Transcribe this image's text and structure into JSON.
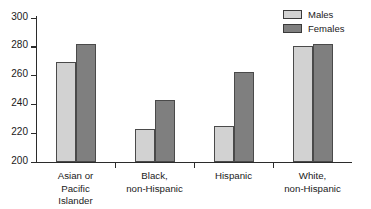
{
  "chart_data": {
    "type": "bar",
    "title": "",
    "xlabel": "",
    "ylabel": "",
    "ylim": [
      200,
      300
    ],
    "yticks": [
      200,
      220,
      240,
      260,
      280,
      300
    ],
    "grid": false,
    "legend_position": "top-right",
    "categories": [
      "Asian or\nPacific\nIslander",
      "Black,\nnon-Hispanic",
      "Hispanic",
      "White,\nnon-Hispanic"
    ],
    "series": [
      {
        "name": "Males",
        "color": "#d2d2d2",
        "values": [
          269,
          223,
          225,
          280
        ]
      },
      {
        "name": "Females",
        "color": "#7f7f7f",
        "values": [
          282,
          243,
          262,
          282
        ]
      }
    ]
  },
  "legend": {
    "items": [
      {
        "label": "Males",
        "color": "#d2d2d2"
      },
      {
        "label": "Females",
        "color": "#7f7f7f"
      }
    ]
  },
  "axes": {
    "y": {
      "ticks": [
        {
          "label": "300",
          "value": 300
        },
        {
          "label": "280",
          "value": 280
        },
        {
          "label": "260",
          "value": 260
        },
        {
          "label": "240",
          "value": 240
        },
        {
          "label": "220",
          "value": 220
        },
        {
          "label": "200",
          "value": 200
        }
      ]
    },
    "x": {
      "categories": [
        {
          "lines": [
            "Asian or",
            "Pacific",
            "Islander"
          ]
        },
        {
          "lines": [
            "Black,",
            "non-Hispanic"
          ]
        },
        {
          "lines": [
            "Hispanic"
          ]
        },
        {
          "lines": [
            "White,",
            "non-Hispanic"
          ]
        }
      ]
    }
  },
  "colors": {
    "males": "#d2d2d2",
    "females": "#7f7f7f",
    "axis": "#2b2b2b",
    "bar_border": "#4a4a4a",
    "background": "#ffffff"
  }
}
